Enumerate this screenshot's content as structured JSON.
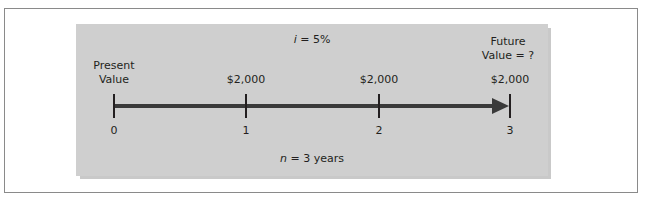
{
  "diagram": {
    "type": "timeline",
    "interest_label_var": "i",
    "interest_label_rest": " = 5%",
    "periods_label_var": "n",
    "periods_label_rest": " = 3 years",
    "present_value_line1": "Present",
    "present_value_line2": "Value",
    "future_value_line1": "Future",
    "future_value_line2": "Value = ?",
    "points": [
      {
        "period": "0",
        "cash_flow": ""
      },
      {
        "period": "1",
        "cash_flow": "$2,000"
      },
      {
        "period": "2",
        "cash_flow": "$2,000"
      },
      {
        "period": "3",
        "cash_flow": "$2,000"
      }
    ],
    "colors": {
      "panel": "#cfcfcf",
      "line": "#3a3a3a",
      "text": "#231f20"
    }
  }
}
